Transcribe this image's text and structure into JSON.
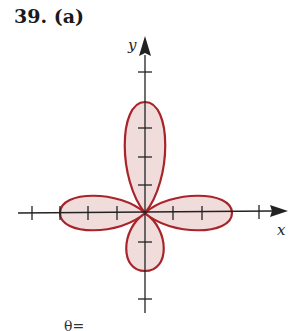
{
  "problem": {
    "number": "39.",
    "part": "(a)"
  },
  "axes": {
    "x_label": "x",
    "y_label": "y"
  },
  "bottom_text": "θ=",
  "colors": {
    "petal_stroke": "#a8242a",
    "petal_fill": "#f1dcdc",
    "axis": "#222222"
  },
  "curve": {
    "type": "four-leaf rose",
    "petals": 4,
    "orientation": "along axes",
    "tick_count_per_petal": 2
  }
}
